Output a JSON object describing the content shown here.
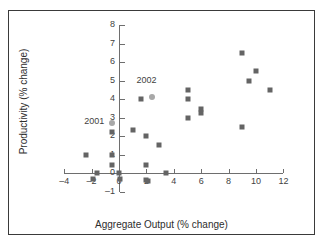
{
  "chart_data": {
    "type": "scatter",
    "title": "",
    "xlabel": "Aggregate Output (% change)",
    "ylabel": "Productivity (% change)",
    "xlim": [
      -4,
      12
    ],
    "ylim": [
      -1,
      8
    ],
    "xticks": [
      -4,
      -2,
      0,
      2,
      4,
      6,
      8,
      10,
      12
    ],
    "xtick_labels": [
      "–4",
      "–2",
      "0",
      "2",
      "4",
      "6",
      "8",
      "10",
      "12"
    ],
    "yticks": [
      -1,
      0,
      1,
      2,
      3,
      4,
      5,
      6,
      7,
      8
    ],
    "ytick_labels": [
      "–1",
      "0",
      "1",
      "2",
      "3",
      "4",
      "5",
      "6",
      "7",
      "8"
    ],
    "grid": false,
    "legend": false,
    "marker_color": "#646464",
    "highlight_color": "#a8a8a8",
    "series": [
      {
        "name": "observations",
        "marker": "square",
        "points": [
          {
            "x": -2.4,
            "y": 1.0
          },
          {
            "x": -1.6,
            "y": 0.0
          },
          {
            "x": -1.9,
            "y": -0.3
          },
          {
            "x": -0.5,
            "y": 2.2
          },
          {
            "x": -0.5,
            "y": 1.0
          },
          {
            "x": -0.5,
            "y": 0.45
          },
          {
            "x": 0.0,
            "y": 0.0
          },
          {
            "x": 0.1,
            "y": -0.35
          },
          {
            "x": 1.0,
            "y": 2.3
          },
          {
            "x": 1.6,
            "y": 4.0
          },
          {
            "x": 2.0,
            "y": 2.0
          },
          {
            "x": 2.0,
            "y": 0.45
          },
          {
            "x": 2.0,
            "y": -0.4
          },
          {
            "x": 2.1,
            "y": -0.45
          },
          {
            "x": 2.9,
            "y": 1.5
          },
          {
            "x": 3.4,
            "y": 0.0
          },
          {
            "x": 5.0,
            "y": 4.5
          },
          {
            "x": 5.0,
            "y": 4.0
          },
          {
            "x": 5.0,
            "y": 3.0
          },
          {
            "x": 6.0,
            "y": 3.45
          },
          {
            "x": 6.0,
            "y": 3.25
          },
          {
            "x": 9.0,
            "y": 6.5
          },
          {
            "x": 10.0,
            "y": 5.5
          },
          {
            "x": 9.5,
            "y": 5.0
          },
          {
            "x": 11.0,
            "y": 4.5
          },
          {
            "x": 9.0,
            "y": 2.5
          }
        ]
      },
      {
        "name": "highlighted-years",
        "marker": "circle",
        "points": [
          {
            "x": -0.5,
            "y": 2.7,
            "label": "2001"
          },
          {
            "x": 2.4,
            "y": 4.1,
            "label": "2002"
          }
        ]
      }
    ],
    "annotations": [
      {
        "text": "2001",
        "x": -1.8,
        "y": 2.75
      },
      {
        "text": "2002",
        "x": 2.0,
        "y": 4.95
      }
    ]
  }
}
